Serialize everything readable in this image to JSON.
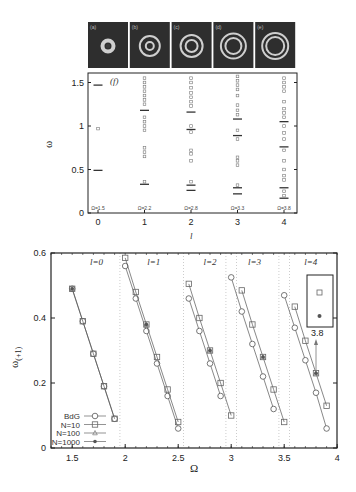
{
  "figure": {
    "panel_images": [
      {
        "label": "(a)"
      },
      {
        "label": "(b)"
      },
      {
        "label": "(c)"
      },
      {
        "label": "(d)"
      },
      {
        "label": "(e)"
      }
    ]
  },
  "chart_data": [
    {
      "type": "scatter",
      "panel_label": "(f)",
      "title": "",
      "xlabel": "l",
      "ylabel": "ω",
      "xlim": [
        -0.2,
        4.2
      ],
      "ylim": [
        0,
        1.6
      ],
      "x_ticks": [
        "0",
        "1",
        "2",
        "3",
        "4"
      ],
      "y_ticks": [
        "0",
        "0.5",
        "1",
        "1.5"
      ],
      "grid": false,
      "annotations": [
        "Ω=1.5",
        "Ω=2.2",
        "Ω=2.8",
        "Ω=3.3",
        "Ω=3.8"
      ],
      "series": [
        {
          "name": "bars (BdG)",
          "marker": "dash",
          "points": [
            [
              0,
              1.47
            ],
            [
              0,
              0.49
            ],
            [
              1,
              1.18
            ],
            [
              1,
              0.33
            ],
            [
              2,
              1.16
            ],
            [
              2,
              0.96
            ],
            [
              2,
              0.32
            ],
            [
              2,
              0.26
            ],
            [
              3,
              1.08
            ],
            [
              3,
              0.89
            ],
            [
              3,
              0.29
            ],
            [
              3,
              0.22
            ],
            [
              4,
              1.05
            ],
            [
              4,
              0.76
            ],
            [
              4,
              0.29
            ],
            [
              4,
              0.17
            ]
          ]
        },
        {
          "name": "squares (N-particle)",
          "marker": "square",
          "points": [
            [
              0,
              0.97
            ],
            [
              1,
              1.55
            ],
            [
              1,
              1.5
            ],
            [
              1,
              1.45
            ],
            [
              1,
              1.4
            ],
            [
              1,
              1.35
            ],
            [
              1,
              1.3
            ],
            [
              1,
              1.25
            ],
            [
              1,
              1.1
            ],
            [
              1,
              1.05
            ],
            [
              1,
              1.0
            ],
            [
              1,
              0.95
            ],
            [
              1,
              0.75
            ],
            [
              1,
              0.7
            ],
            [
              1,
              0.65
            ],
            [
              1,
              0.36
            ],
            [
              2,
              1.55
            ],
            [
              2,
              1.5
            ],
            [
              2,
              1.44
            ],
            [
              2,
              1.38
            ],
            [
              2,
              1.33
            ],
            [
              2,
              1.28
            ],
            [
              2,
              1.23
            ],
            [
              2,
              1.0
            ],
            [
              2,
              0.93
            ],
            [
              2,
              0.72
            ],
            [
              2,
              0.68
            ],
            [
              2,
              0.6
            ],
            [
              2,
              0.36
            ],
            [
              3,
              1.57
            ],
            [
              3,
              1.52
            ],
            [
              3,
              1.47
            ],
            [
              3,
              1.42
            ],
            [
              3,
              1.35
            ],
            [
              3,
              1.24
            ],
            [
              3,
              1.18
            ],
            [
              3,
              1.13
            ],
            [
              3,
              0.95
            ],
            [
              3,
              0.85
            ],
            [
              3,
              0.64
            ],
            [
              3,
              0.6
            ],
            [
              3,
              0.55
            ],
            [
              3,
              0.32
            ],
            [
              4,
              1.55
            ],
            [
              4,
              1.5
            ],
            [
              4,
              1.45
            ],
            [
              4,
              1.4
            ],
            [
              4,
              1.28
            ],
            [
              4,
              1.2
            ],
            [
              4,
              1.15
            ],
            [
              4,
              1.1
            ],
            [
              4,
              1.0
            ],
            [
              4,
              0.92
            ],
            [
              4,
              0.85
            ],
            [
              4,
              0.72
            ],
            [
              4,
              0.6
            ],
            [
              4,
              0.5
            ],
            [
              4,
              0.43
            ],
            [
              4,
              0.38
            ],
            [
              4,
              0.25
            ],
            [
              4,
              0.2
            ]
          ]
        }
      ]
    },
    {
      "type": "line",
      "xlabel": "Ω",
      "ylabel": "ω(+1)",
      "xlim": [
        1.3,
        4.0
      ],
      "ylim": [
        0,
        0.6
      ],
      "x_ticks": [
        "1.5",
        "2",
        "2.5",
        "3",
        "3.5",
        "4"
      ],
      "y_ticks": [
        "0",
        "0.2",
        "0.4",
        "0.6"
      ],
      "grid": "vertical dotted separators at Ω≈1.95, 2.55, 2.95, 3.05, 3.45, 3.55",
      "region_labels": [
        "l=0",
        "l=1",
        "l=2",
        "l=3",
        "l=4"
      ],
      "legend": {
        "position": "lower left",
        "entries": [
          "BdG",
          "N=10",
          "N=100",
          "N=1000"
        ]
      },
      "inset": {
        "x_label": "3.8"
      },
      "series": [
        {
          "name": "BdG",
          "marker": "circle",
          "groups": [
            {
              "l": 0,
              "x": [
                1.5,
                1.6,
                1.7,
                1.8,
                1.9
              ],
              "y": [
                0.49,
                0.39,
                0.29,
                0.19,
                0.09
              ]
            },
            {
              "l": 1,
              "x": [
                2.0,
                2.1,
                2.2,
                2.3,
                2.4,
                2.5
              ],
              "y": [
                0.56,
                0.46,
                0.36,
                0.26,
                0.16,
                0.06
              ]
            },
            {
              "l": 2,
              "x": [
                2.6,
                2.7,
                2.8,
                2.9
              ],
              "y": [
                0.46,
                0.36,
                0.26,
                0.16
              ]
            },
            {
              "l": 3,
              "x": [
                3.0,
                3.1,
                3.2,
                3.3,
                3.4
              ],
              "y": [
                0.525,
                0.42,
                0.32,
                0.22,
                0.12
              ]
            },
            {
              "l": 4,
              "x": [
                3.5,
                3.6,
                3.7,
                3.8,
                3.9
              ],
              "y": [
                0.47,
                0.37,
                0.27,
                0.17,
                0.06
              ]
            }
          ]
        },
        {
          "name": "N=10",
          "marker": "square",
          "groups": [
            {
              "l": 0,
              "x": [
                1.5,
                1.6,
                1.7,
                1.8,
                1.9
              ],
              "y": [
                0.49,
                0.39,
                0.29,
                0.19,
                0.09
              ]
            },
            {
              "l": 1,
              "x": [
                2.0,
                2.1,
                2.2,
                2.3,
                2.4,
                2.5
              ],
              "y": [
                0.585,
                0.48,
                0.38,
                0.28,
                0.18,
                0.08
              ]
            },
            {
              "l": 2,
              "x": [
                2.6,
                2.7,
                2.8,
                2.9,
                3.0
              ],
              "y": [
                0.505,
                0.4,
                0.3,
                0.2,
                0.1
              ]
            },
            {
              "l": 3,
              "x": [
                3.1,
                3.2,
                3.3,
                3.4,
                3.5
              ],
              "y": [
                0.485,
                0.38,
                0.28,
                0.18,
                0.08
              ]
            },
            {
              "l": 4,
              "x": [
                3.6,
                3.7,
                3.8,
                3.9
              ],
              "y": [
                0.435,
                0.33,
                0.23,
                0.13
              ]
            }
          ]
        },
        {
          "name": "N=100",
          "marker": "triangle",
          "points": [
            [
              1.5,
              0.49
            ],
            [
              2.2,
              0.38
            ],
            [
              2.8,
              0.3
            ],
            [
              3.3,
              0.28
            ],
            [
              3.8,
              0.23
            ]
          ]
        },
        {
          "name": "N=1000",
          "marker": "filled-circle",
          "points": [
            [
              1.5,
              0.49
            ],
            [
              2.2,
              0.38
            ],
            [
              2.8,
              0.3
            ],
            [
              3.3,
              0.28
            ],
            [
              3.8,
              0.23
            ]
          ]
        }
      ]
    }
  ]
}
